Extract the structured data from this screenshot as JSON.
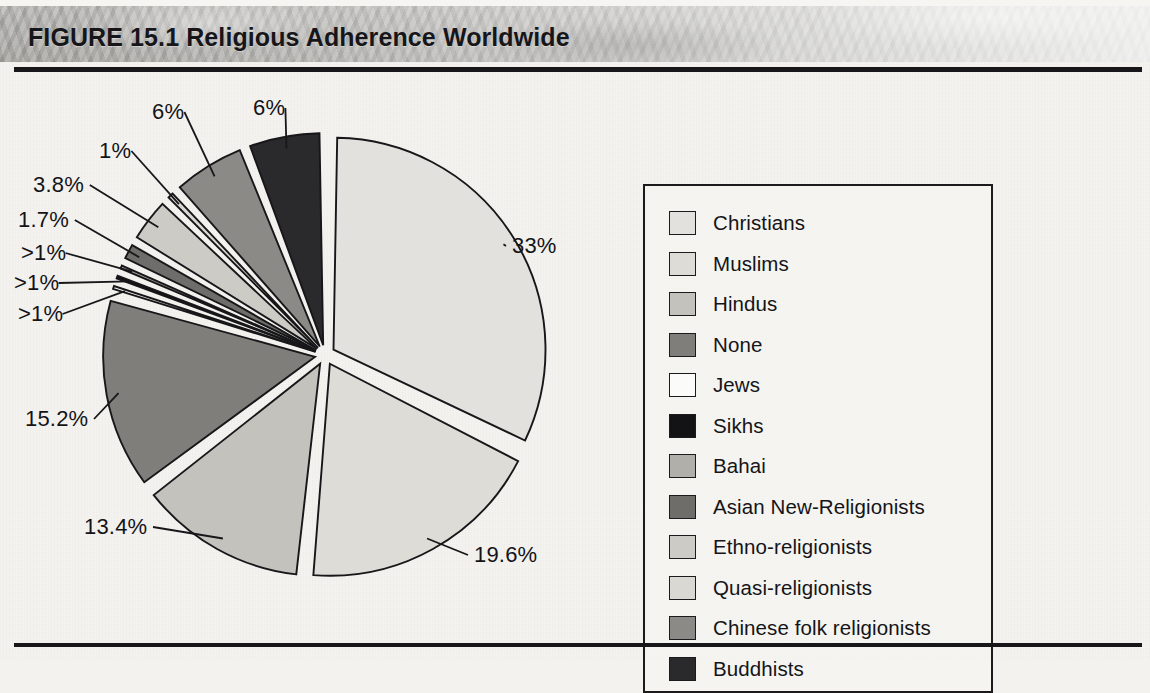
{
  "figure": {
    "title": "FIGURE 15.1  Religious Adherence Worldwide",
    "title_number": "FIGURE 15.1",
    "title_text": "Religious Adherence Worldwide"
  },
  "colors": {
    "ink": "#17171a",
    "paper": "#f4f3f0",
    "band_light": "#c9c8c5",
    "band_dark": "#b9b8b4"
  },
  "legend": {
    "items": [
      {
        "label": "Christians",
        "swatch": "#e2e1dd"
      },
      {
        "label": "Muslims",
        "swatch": "#dedcd7"
      },
      {
        "label": "Hindus",
        "swatch": "#c3c2bd"
      },
      {
        "label": "None",
        "swatch": "#7f7e7a"
      },
      {
        "label": "Jews",
        "swatch": "#fbfbf9"
      },
      {
        "label": "Sikhs",
        "swatch": "#131315"
      },
      {
        "label": "Bahai",
        "swatch": "#b0afaa"
      },
      {
        "label": "Asian New-Religionists",
        "swatch": "#6e6d69"
      },
      {
        "label": "Ethno-religionists",
        "swatch": "#cccbc6"
      },
      {
        "label": "Quasi-religionists",
        "swatch": "#d9d8d3"
      },
      {
        "label": "Chinese folk religionists",
        "swatch": "#8b8a86"
      },
      {
        "label": "Buddhists",
        "swatch": "#2a2a2c"
      }
    ]
  },
  "chart_data": {
    "type": "pie",
    "title": "Religious Adherence Worldwide",
    "exploded": true,
    "start_angle_deg": 0,
    "direction": "clockwise",
    "legend_position": "right",
    "categories": [
      "Christians",
      "Muslims",
      "Hindus",
      "None",
      "Jews",
      "Sikhs",
      "Bahai",
      "Asian New-Religionists",
      "Ethno-religionists",
      "Quasi-religionists",
      "Chinese folk religionists",
      "Buddhists"
    ],
    "values": [
      33,
      19.6,
      13.4,
      15.2,
      0.8,
      0.8,
      0.8,
      1.7,
      3.8,
      1,
      6,
      6
    ],
    "labels": [
      "33%",
      "19.6%",
      "13.4%",
      "15.2%",
      ">1%",
      ">1%",
      ">1%",
      "1.7%",
      "3.8%",
      "1%",
      "6%",
      "6%"
    ],
    "colors": [
      "#e2e1dd",
      "#dedcd7",
      "#c3c2bd",
      "#7f7e7a",
      "#fbfbf9",
      "#131315",
      "#b0afaa",
      "#6e6d69",
      "#cccbc6",
      "#d9d8d3",
      "#8b8a86",
      "#2a2a2c"
    ],
    "slices": [
      {
        "name": "Christians",
        "label": "33%",
        "value": 33,
        "color": "#e2e1dd"
      },
      {
        "name": "Muslims",
        "label": "19.6%",
        "value": 19.6,
        "color": "#dedcd7"
      },
      {
        "name": "Hindus",
        "label": "13.4%",
        "value": 13.4,
        "color": "#c3c2bd"
      },
      {
        "name": "None",
        "label": "15.2%",
        "value": 15.2,
        "color": "#7f7e7a"
      },
      {
        "name": "Jews",
        "label": ">1%",
        "value": 0.8,
        "color": "#fbfbf9"
      },
      {
        "name": "Sikhs",
        "label": ">1%",
        "value": 0.8,
        "color": "#131315"
      },
      {
        "name": "Bahai",
        "label": ">1%",
        "value": 0.8,
        "color": "#b0afaa"
      },
      {
        "name": "Asian New-Religionists",
        "label": "1.7%",
        "value": 1.7,
        "color": "#6e6d69"
      },
      {
        "name": "Ethno-religionists",
        "label": "3.8%",
        "value": 3.8,
        "color": "#cccbc6"
      },
      {
        "name": "Quasi-religionists",
        "label": "1%",
        "value": 1,
        "color": "#d9d8d3"
      },
      {
        "name": "Chinese folk religionists",
        "label": "6%",
        "value": 6,
        "color": "#8b8a86"
      },
      {
        "name": "Buddhists",
        "label": "6%",
        "value": 6,
        "color": "#2a2a2c"
      }
    ]
  },
  "pie_labels": [
    {
      "text": "33%",
      "x": 512,
      "y": 157
    },
    {
      "text": "19.6%",
      "x": 474,
      "y": 466
    },
    {
      "text": "13.4%",
      "x": 84,
      "y": 438
    },
    {
      "text": "15.2%",
      "x": 25,
      "y": 330
    },
    {
      "text": ">1%",
      "x": 18,
      "y": 225
    },
    {
      "text": ">1%",
      "x": 14,
      "y": 194
    },
    {
      "text": ">1%",
      "x": 21,
      "y": 164
    },
    {
      "text": "1.7%",
      "x": 18,
      "y": 131
    },
    {
      "text": "3.8%",
      "x": 33,
      "y": 96
    },
    {
      "text": "1%",
      "x": 99,
      "y": 62
    },
    {
      "text": "6%",
      "x": 152,
      "y": 23
    },
    {
      "text": "6%",
      "x": 253,
      "y": 19
    }
  ]
}
